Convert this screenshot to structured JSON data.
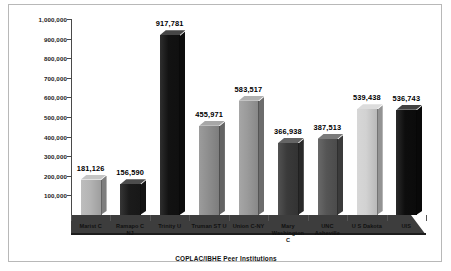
{
  "chart_data": {
    "type": "bar",
    "title": "",
    "xlabel": "COPLAC/IBHE Peer Institutions",
    "ylabel": "",
    "ylim": [
      0,
      1000000
    ],
    "ytick_labels": [
      "1,000,000",
      "900,000",
      "800,000",
      "700,000",
      "600,000",
      "500,000",
      "400,000",
      "300,000",
      "200,000",
      "100,000"
    ],
    "ytick_values": [
      1000000,
      900000,
      800000,
      700000,
      600000,
      500000,
      400000,
      300000,
      200000,
      100000
    ],
    "grid": false,
    "legend": "none",
    "style": "3d-column",
    "categories": [
      "Marist C",
      "Ramapo C NJ",
      "Trinity U",
      "Truman ST U",
      "Union C-NY",
      "Mary Washington C",
      "UNC Asheville",
      "U S Dakota",
      "UIS"
    ],
    "values": [
      181126,
      156590,
      917781,
      455971,
      583517,
      366938,
      387513,
      539438,
      536743
    ],
    "data_labels": [
      "181,126",
      "156,590",
      "917,781",
      "455,971",
      "583,517",
      "366,938",
      "387,513",
      "539,438",
      "536,743"
    ],
    "bar_fills": [
      "#b4b4b4",
      "#1b1b1b",
      "#121212",
      "#8e8e8e",
      "#9a9a9a",
      "#3a3a3a",
      "#555555",
      "#d2d2d2",
      "#0d0d0d"
    ],
    "bar_label_lines": [
      [
        "Marist C"
      ],
      [
        "Ramapo C",
        "NJ"
      ],
      [
        "Trinity U"
      ],
      [
        "Truman ST U"
      ],
      [
        "Union C-NY"
      ],
      [
        "Mary",
        "Washington",
        "C"
      ],
      [
        "UNC",
        "Asheville"
      ],
      [
        "U S Dakota"
      ],
      [
        "UIS"
      ]
    ]
  },
  "colors": {
    "axis": "#4a4a4a",
    "floor": "#3d3d3d",
    "frame": "#b8b8b8",
    "text": "#111111"
  }
}
